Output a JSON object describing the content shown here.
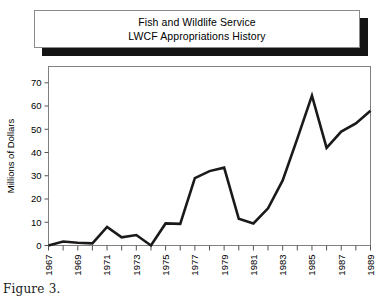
{
  "figure": {
    "caption": "Figure 3."
  },
  "title_box": {
    "line1": "Fish and Wildlife Service",
    "line2": "LWCF Appropriations History",
    "border_color": "#8a8a8a",
    "shadow_color": "#141414",
    "background": "#ffffff"
  },
  "chart_data": {
    "type": "line",
    "title": "Fish and Wildlife Service LWCF Appropriations History",
    "xlabel": "",
    "ylabel": "Millions of Dollars",
    "x": [
      1967,
      1968,
      1969,
      1970,
      1971,
      1972,
      1973,
      1974,
      1975,
      1976,
      1977,
      1978,
      1979,
      1980,
      1981,
      1982,
      1983,
      1984,
      1985,
      1986,
      1987,
      1988,
      1989
    ],
    "values": [
      0,
      1.7,
      1.2,
      0.9,
      8.0,
      3.5,
      4.5,
      0,
      9.5,
      9.3,
      29.0,
      32.0,
      33.5,
      11.5,
      9.5,
      16.0,
      28.0,
      46.0,
      64.5,
      42.0,
      49.0,
      52.5,
      58.0
    ],
    "xlim": [
      1967,
      1989
    ],
    "ylim": [
      0,
      77
    ],
    "yticks": [
      0,
      10,
      20,
      30,
      40,
      50,
      60,
      70
    ],
    "ytick_labels": [
      "0",
      "10",
      "20",
      "30",
      "40",
      "50",
      "60",
      "70"
    ],
    "xticks": [
      1967,
      1968,
      1969,
      1970,
      1971,
      1972,
      1973,
      1974,
      1975,
      1976,
      1977,
      1978,
      1979,
      1980,
      1981,
      1982,
      1983,
      1984,
      1985,
      1986,
      1987,
      1988,
      1989
    ],
    "xtick_labels": [
      "1967",
      "",
      "1969",
      "",
      "1971",
      "",
      "1973",
      "",
      "1975",
      "",
      "1977",
      "",
      "1979",
      "",
      "1981",
      "",
      "1983",
      "",
      "1985",
      "",
      "1987",
      "",
      "1989"
    ],
    "grid": false,
    "legend": null,
    "line_color": "#1a1a1a",
    "line_width": 2.6,
    "frame_color": "#808080"
  }
}
